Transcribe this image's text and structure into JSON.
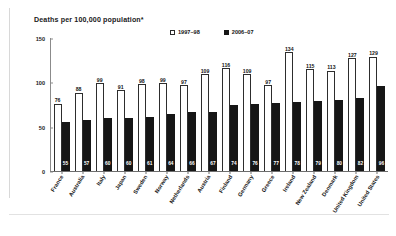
{
  "chart_data": {
    "type": "bar",
    "title": "Deaths per 100,000 population*",
    "xlabel": "",
    "ylabel": "",
    "ylim": [
      0,
      150
    ],
    "yticks": [
      0,
      50,
      100,
      150
    ],
    "grid": false,
    "legend_position": "top-center",
    "categories": [
      "France",
      "Australia",
      "Italy",
      "Japan",
      "Sweden",
      "Norway",
      "Netherlands",
      "Austria",
      "Finland",
      "Germany",
      "Greece",
      "Ireland",
      "New Zealand",
      "Denmark",
      "United Kingdom",
      "United States"
    ],
    "series": [
      {
        "name": "1997–98",
        "color": "#ffffff",
        "values": [
          76,
          88,
          99,
          91,
          98,
          99,
          97,
          109,
          116,
          109,
          97,
          134,
          115,
          113,
          127,
          129
        ]
      },
      {
        "name": "2006–07",
        "color": "#161616",
        "values": [
          55,
          57,
          60,
          60,
          61,
          64,
          66,
          67,
          74,
          76,
          77,
          78,
          79,
          80,
          82,
          96
        ]
      }
    ]
  },
  "legend": {
    "items": [
      {
        "label": "1997–98",
        "swatch": "open-square-icon"
      },
      {
        "label": "2006–07",
        "swatch": "filled-square-icon"
      }
    ]
  }
}
